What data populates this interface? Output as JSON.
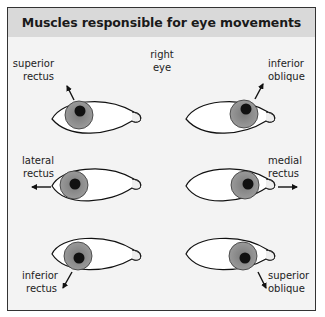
{
  "title": "Muscles responsible for eye movements",
  "center_label": [
    "right",
    "eye"
  ],
  "colors": {
    "frame_border": "#333333",
    "header_bg": "#d9d9d9",
    "body_bg": "#f3f3f3",
    "sclera": "#ffffff",
    "iris": "#8c8c8c",
    "pupil": "#111111",
    "outline": "#111111"
  },
  "eyes": [
    {
      "position": "top-left",
      "muscle": [
        "superior",
        "rectus"
      ],
      "direction": "up-left"
    },
    {
      "position": "top-right",
      "muscle": [
        "inferior",
        "oblique"
      ],
      "direction": "up-right"
    },
    {
      "position": "middle-left",
      "muscle": [
        "lateral",
        "rectus"
      ],
      "direction": "left"
    },
    {
      "position": "middle-right",
      "muscle": [
        "medial",
        "rectus"
      ],
      "direction": "right"
    },
    {
      "position": "bottom-left",
      "muscle": [
        "inferior",
        "rectus"
      ],
      "direction": "down-left"
    },
    {
      "position": "bottom-right",
      "muscle": [
        "superior",
        "oblique"
      ],
      "direction": "down-right"
    }
  ]
}
